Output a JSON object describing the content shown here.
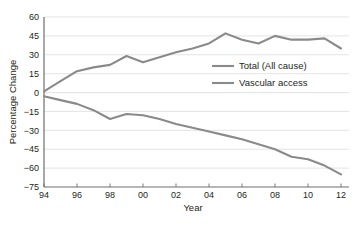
{
  "chart_data": {
    "type": "line",
    "title": "",
    "xlabel": "Year",
    "ylabel": "Percentage Change",
    "x": [
      1994,
      1995,
      1996,
      1997,
      1998,
      1999,
      2000,
      2001,
      2002,
      2003,
      2004,
      2005,
      2006,
      2007,
      2008,
      2009,
      2010,
      2011,
      2012
    ],
    "x_tick_labels": [
      "94",
      "96",
      "98",
      "00",
      "02",
      "04",
      "06",
      "08",
      "10",
      "12"
    ],
    "x_tick_values": [
      1994,
      1996,
      1998,
      2000,
      2002,
      2004,
      2006,
      2008,
      2010,
      2012
    ],
    "xlim": [
      1994,
      2012
    ],
    "y_tick_labels": [
      "60",
      "45",
      "30",
      "15",
      "0",
      "−15",
      "−30",
      "−45",
      "−60",
      "−75"
    ],
    "y_tick_values": [
      60,
      45,
      30,
      15,
      0,
      -15,
      -30,
      -45,
      -60,
      -75
    ],
    "ylim": [
      -75,
      60
    ],
    "grid": true,
    "legend_position": "center-right",
    "series": [
      {
        "name": "Total (All cause)",
        "color": "#8a8a8a",
        "values": [
          1,
          9,
          17,
          20,
          22,
          29,
          24,
          28,
          32,
          35,
          39,
          47,
          42,
          39,
          45,
          42,
          42,
          43,
          35
        ]
      },
      {
        "name": "Vascular access",
        "color": "#8a8a8a",
        "values": [
          -3,
          -6,
          -9,
          -14,
          -21,
          -17,
          -18,
          -21,
          -25,
          -28,
          -31,
          -34,
          -37,
          -41,
          -45,
          -51,
          -53,
          -58,
          -65
        ]
      }
    ]
  },
  "axes": {
    "x_title": "Year",
    "y_title": "Percentage Change"
  },
  "legend": {
    "items": [
      {
        "label": "Total (All cause)"
      },
      {
        "label": "Vascular access"
      }
    ]
  }
}
